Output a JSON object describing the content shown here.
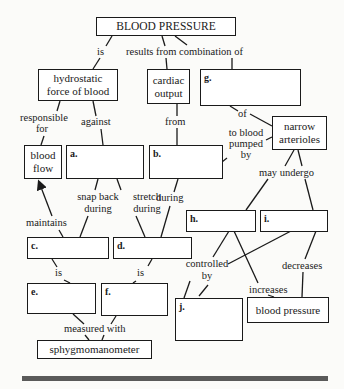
{
  "diagram": {
    "title": "BLOOD PRESSURE",
    "concepts": {
      "hydrostatic": "hydrostatic force of blood",
      "cardiac_output": "cardiac output",
      "blood_flow": "blood flow",
      "narrow_arterioles": "narrow arterioles",
      "blood_pressure": "blood pressure",
      "sphygmomanometer": "sphygmomanometer"
    },
    "blanks": {
      "a": "a.",
      "b": "b.",
      "c": "c.",
      "d": "d.",
      "e": "e.",
      "f": "f.",
      "g": "g.",
      "h": "h.",
      "i": "i.",
      "j": "j."
    },
    "links": {
      "is_top": "is",
      "results_from": "results from combination of",
      "responsible_for": "responsible for",
      "against": "against",
      "from": "from",
      "of": "of",
      "to_blood_pumped_by": "to blood pumped by",
      "snap_back_during": "snap back during",
      "stretch_during": "stretch during",
      "during": "during",
      "may_undergo": "may undergo",
      "maintains": "maintains",
      "is_c": "is",
      "is_d": "is",
      "controlled_by": "controlled by",
      "decreases": "decreases",
      "increases": "increases",
      "measured_with": "measured with"
    },
    "colors": {
      "ink": "#1a1a1a",
      "background": "#fbfbf9",
      "bar": "#5a5a5a"
    }
  }
}
